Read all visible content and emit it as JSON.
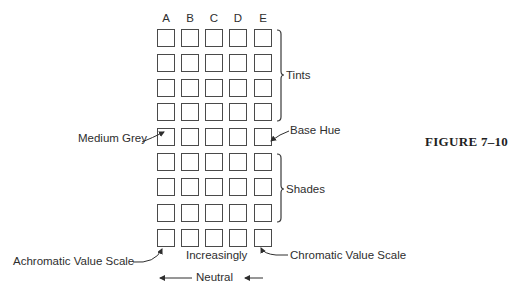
{
  "figure": {
    "label": "FIGURE 7–10"
  },
  "grid": {
    "columns": [
      "A",
      "B",
      "C",
      "D",
      "E"
    ],
    "rows": 9
  },
  "annotations": {
    "tints": "Tints",
    "shades": "Shades",
    "medium_grey": "Medium Grey",
    "base_hue": "Base Hue",
    "achromatic": "Achromatic Value Scale",
    "chromatic": "Chromatic Value Scale",
    "increasingly": "Increasingly",
    "neutral": "Neutral"
  },
  "colors": {
    "stroke": "#4a4a4a",
    "text": "#2e2e2e",
    "background": "#ffffff"
  }
}
